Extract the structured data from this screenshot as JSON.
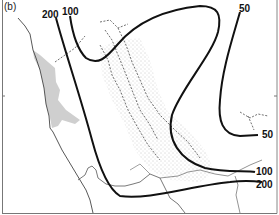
{
  "figure": {
    "panel_label": "(b)",
    "contours": [
      {
        "id": "c200-west",
        "value": "200",
        "label_pos": [
          44,
          8
        ]
      },
      {
        "id": "c100-west",
        "value": "100",
        "label_pos": [
          64,
          6
        ]
      },
      {
        "id": "c50-north",
        "value": "50",
        "label_pos": [
          240,
          5
        ]
      },
      {
        "id": "c50-east",
        "value": "50",
        "label_pos": [
          263,
          128
        ]
      },
      {
        "id": "c100-south",
        "value": "100",
        "label_pos": [
          255,
          170
        ]
      },
      {
        "id": "c200-south",
        "value": "200",
        "label_pos": [
          257,
          184
        ]
      }
    ],
    "colors": {
      "contour": "#111111",
      "coastline": "#444444",
      "shaded_area": "#cfcfcf",
      "stipple": "#888888",
      "rivers": "#333333",
      "frame": "#777777"
    }
  }
}
